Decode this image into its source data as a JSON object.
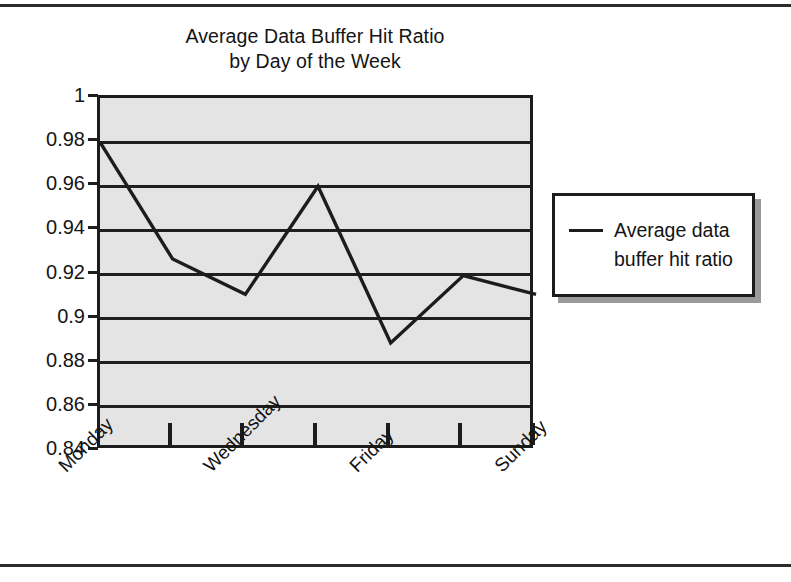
{
  "figure": {
    "title_line_1": "Average Data Buffer Hit Ratio",
    "title_line_2": "by Day of the Week"
  },
  "legend": {
    "entry_line_1": "Average data",
    "entry_line_2": "buffer hit ratio",
    "marker": "line-swatch"
  },
  "axes": {
    "y_tick_labels": [
      "1",
      "0.98",
      "0.96",
      "0.94",
      "0.92",
      "0.9",
      "0.88",
      "0.86",
      "0.84"
    ],
    "x_tick_labels": [
      "Monday",
      "Wednesday",
      "Friday",
      "Sunday"
    ]
  },
  "colors": {
    "plot_background": "#e4e4e4",
    "line": "#1c1c1c",
    "frame": "#1c1c1c",
    "grid": "#1f1f1f",
    "legend_background": "#ffffff",
    "legend_shadow": "#9a9a9a",
    "text": "#141414"
  },
  "chart_data": {
    "type": "line",
    "title": "Average Data Buffer Hit Ratio by Day of the Week",
    "xlabel": "",
    "ylabel": "",
    "categories": [
      "Monday",
      "Tuesday",
      "Wednesday",
      "Thursday",
      "Friday",
      "Saturday",
      "Sunday"
    ],
    "visible_category_labels": [
      "Monday",
      "Wednesday",
      "Friday",
      "Sunday"
    ],
    "series": [
      {
        "name": "Average data buffer hit ratio",
        "values": [
          0.98,
          0.927,
          0.911,
          0.96,
          0.889,
          0.9195,
          0.911
        ]
      }
    ],
    "ylim": [
      0.84,
      1
    ],
    "ytick_values": [
      0.84,
      0.86,
      0.88,
      0.9,
      0.92,
      0.94,
      0.96,
      0.98,
      1
    ],
    "ytick_step": 0.02,
    "grid": true,
    "grid_axis": "y",
    "legend": true,
    "legend_position": "right"
  }
}
